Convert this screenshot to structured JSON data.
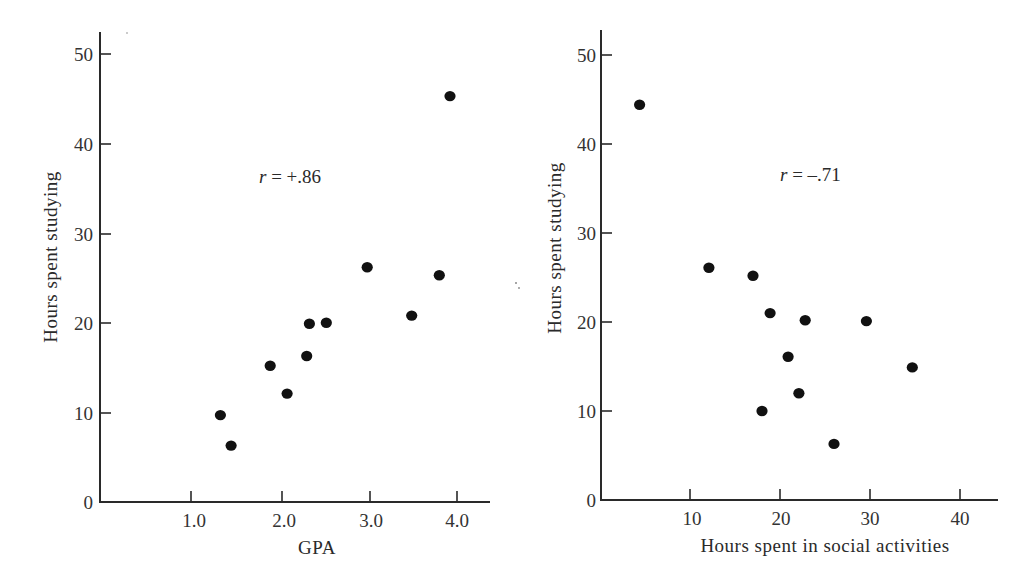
{
  "chart_data": [
    {
      "type": "scatter",
      "title": "",
      "xlabel": "GPA",
      "ylabel": "Hours spent studying",
      "annotation": "r = +.86",
      "annotation_var": "r",
      "annotation_rest": " = +.86",
      "xlim": [
        0,
        4.4
      ],
      "ylim": [
        0,
        52
      ],
      "xticks": [
        1.0,
        2.0,
        3.0,
        4.0
      ],
      "xtick_labels": [
        "1.0",
        "2.0",
        "3.0",
        "4.0"
      ],
      "yticks": [
        0,
        10,
        20,
        30,
        40,
        50
      ],
      "ytick_labels": [
        "0",
        "10",
        "20",
        "30",
        "40",
        "50"
      ],
      "grid": false,
      "legend": null,
      "points": [
        {
          "x": 1.33,
          "y": 9.7
        },
        {
          "x": 1.45,
          "y": 6.3
        },
        {
          "x": 1.89,
          "y": 15.2
        },
        {
          "x": 2.08,
          "y": 12.1
        },
        {
          "x": 2.3,
          "y": 16.3
        },
        {
          "x": 2.33,
          "y": 19.9
        },
        {
          "x": 2.52,
          "y": 20.0
        },
        {
          "x": 2.98,
          "y": 26.2
        },
        {
          "x": 3.48,
          "y": 20.8
        },
        {
          "x": 3.79,
          "y": 25.3
        },
        {
          "x": 3.91,
          "y": 45.3
        }
      ]
    },
    {
      "type": "scatter",
      "title": "",
      "xlabel": "Hours spent in social activities",
      "ylabel": "Hours spent studying",
      "annotation": "r = –.71",
      "annotation_var": "r",
      "annotation_rest": " = –.71",
      "xlim": [
        0,
        44
      ],
      "ylim": [
        0,
        52
      ],
      "xticks": [
        10,
        20,
        30,
        40
      ],
      "xtick_labels": [
        "10",
        "20",
        "30",
        "40"
      ],
      "yticks": [
        0,
        10,
        20,
        30,
        40,
        50
      ],
      "ytick_labels": [
        "0",
        "10",
        "20",
        "30",
        "40",
        "50"
      ],
      "grid": false,
      "legend": null,
      "points": [
        {
          "x": 4.4,
          "y": 44.4
        },
        {
          "x": 12.1,
          "y": 26.1
        },
        {
          "x": 17.0,
          "y": 25.2
        },
        {
          "x": 18.9,
          "y": 21.0
        },
        {
          "x": 22.8,
          "y": 20.2
        },
        {
          "x": 29.6,
          "y": 20.1
        },
        {
          "x": 20.9,
          "y": 16.1
        },
        {
          "x": 22.1,
          "y": 12.0
        },
        {
          "x": 18.0,
          "y": 10.0
        },
        {
          "x": 26.0,
          "y": 6.3
        },
        {
          "x": 34.7,
          "y": 14.9
        }
      ]
    }
  ],
  "left": {
    "xlabel": "GPA",
    "ylabel": "Hours spent studying",
    "annotation_var": "r",
    "annotation_rest": " = +.86",
    "xtick_labels": [
      "1.0",
      "2.0",
      "3.0",
      "4.0"
    ],
    "ytick_labels": [
      "0",
      "10",
      "20",
      "30",
      "40",
      "50"
    ]
  },
  "right": {
    "xlabel": "Hours spent in social activities",
    "ylabel": "Hours spent studying",
    "annotation_var": "r",
    "annotation_rest": " = –.71",
    "xtick_labels": [
      "10",
      "20",
      "30",
      "40"
    ],
    "ytick_labels": [
      "0",
      "10",
      "20",
      "30",
      "40",
      "50"
    ]
  }
}
